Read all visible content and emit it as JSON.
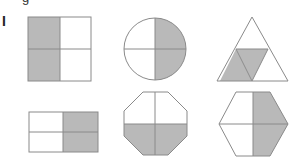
{
  "figure": {
    "label": "I",
    "cropped_text_fragment": "g",
    "colors": {
      "shade": "#b9b9b9",
      "stroke": "#8a8a8a",
      "background": "#ffffff"
    },
    "shapes": [
      {
        "name": "square",
        "parts": 4,
        "shaded": 2,
        "shaded_region": "left half"
      },
      {
        "name": "circle",
        "parts": 4,
        "shaded": 2,
        "shaded_region": "right half"
      },
      {
        "name": "triangle",
        "parts": 4,
        "shaded": 2,
        "shaded_region": "bottom-left and center triangles"
      },
      {
        "name": "rectangle",
        "parts": 4,
        "shaded": 2,
        "shaded_region": "right half"
      },
      {
        "name": "octagon",
        "parts": 4,
        "shaded": 2,
        "shaded_region": "bottom half"
      },
      {
        "name": "hexagon",
        "parts": 4,
        "shaded": 2,
        "shaded_region": "right half"
      }
    ]
  }
}
